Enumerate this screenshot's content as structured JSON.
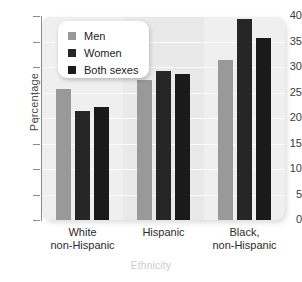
{
  "chart_data": {
    "type": "bar",
    "title": "",
    "xlabel": "Ethnicity",
    "ylabel": "Percentage",
    "categories": [
      "White\nnon-Hispanic",
      "Hispanic",
      "Black,\nnon-Hispanic"
    ],
    "category_lines": [
      [
        "White",
        "non-Hispanic"
      ],
      [
        "Hispanic",
        ""
      ],
      [
        "Black,",
        "non-Hispanic"
      ]
    ],
    "series": [
      {
        "name": "Men",
        "color": "#999999",
        "values": [
          25.7,
          27.5,
          31.4
        ]
      },
      {
        "name": "Women",
        "color": "#262626",
        "values": [
          21.4,
          29.3,
          39.4
        ]
      },
      {
        "name": "Both sexes",
        "color": "#1a1a1a",
        "values": [
          22.2,
          28.6,
          35.7
        ]
      }
    ],
    "ylim": [
      0,
      40
    ],
    "yticks": [
      0,
      5,
      10,
      15,
      20,
      25,
      30,
      35,
      40
    ],
    "ytick_labels": [
      "0",
      "5",
      "10",
      "15",
      "20",
      "25",
      "30",
      "35",
      "40"
    ],
    "grid": true,
    "legend_position": "top-left",
    "panel_background": "#e9e9e9",
    "band_background": "#efefef",
    "gridline_color": "#fbfbfb",
    "axis_color": "#8a8a8a",
    "xtitle_color": "#c9c9c9"
  },
  "legend": {
    "entries": [
      {
        "label": "Men",
        "color": "#999999"
      },
      {
        "label": "Women",
        "color": "#262626"
      },
      {
        "label": "Both sexes",
        "color": "#1a1a1a"
      }
    ]
  }
}
